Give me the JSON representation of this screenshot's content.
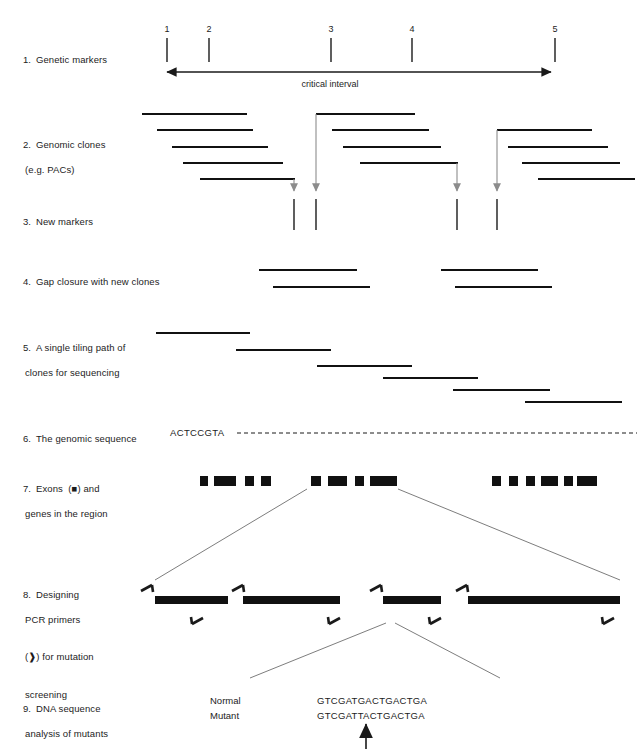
{
  "figure": {
    "colors": {
      "ink": "#1a1a1a",
      "clone_line": "#111111",
      "gray_arrow": "#8c8c8c",
      "connector": "#6e6e6e",
      "exon_fill": "#111111"
    }
  },
  "rows": [
    {
      "num": "1.",
      "line1": "Genetic markers",
      "line2": ""
    },
    {
      "num": "2.",
      "line1": "Genomic clones",
      "line2": "(e.g. PACs)"
    },
    {
      "num": "3.",
      "line1": "New markers",
      "line2": ""
    },
    {
      "num": "4.",
      "line1": "Gap closure with new clones",
      "line2": ""
    },
    {
      "num": "5.",
      "line1": "A single tiling path of",
      "line2": "clones for sequencing"
    },
    {
      "num": "6.",
      "line1": "The genomic sequence",
      "line2": ""
    },
    {
      "num": "7.",
      "line1": "Exons  (■) and",
      "line2": "genes in the region"
    },
    {
      "num": "8.",
      "line1": "Designing",
      "line2": "PCR primers",
      "line3": "(❱) for mutation",
      "line4": "screening"
    },
    {
      "num": "9.",
      "line1": "DNA sequence",
      "line2": "analysis of mutants"
    }
  ],
  "genetic_markers": {
    "labels": [
      "1",
      "2",
      "3",
      "4",
      "5"
    ],
    "x_positions": [
      167,
      209,
      331,
      412,
      555
    ],
    "tick_top": 38,
    "tick_bottom": 62,
    "axis_y": 72,
    "axis_start": 160,
    "axis_end": 558,
    "interval_label": "critical interval",
    "interval_label_x": 330,
    "interval_label_y": 79
  },
  "genomic_clones": {
    "group_a": [
      {
        "x1": 142,
        "x2": 247,
        "y": 114
      },
      {
        "x1": 157,
        "x2": 253,
        "y": 130
      },
      {
        "x1": 172,
        "x2": 268,
        "y": 147
      },
      {
        "x1": 183,
        "x2": 283,
        "y": 163
      },
      {
        "x1": 200,
        "x2": 295,
        "y": 179
      }
    ],
    "group_b": [
      {
        "x1": 316,
        "x2": 415,
        "y": 114
      },
      {
        "x1": 332,
        "x2": 429,
        "y": 130
      },
      {
        "x1": 343,
        "x2": 441,
        "y": 147
      },
      {
        "x1": 360,
        "x2": 458,
        "y": 163
      }
    ],
    "group_c": [
      {
        "x1": 497,
        "x2": 592,
        "y": 130
      },
      {
        "x1": 508,
        "x2": 608,
        "y": 147
      },
      {
        "x1": 522,
        "x2": 620,
        "y": 163
      },
      {
        "x1": 538,
        "x2": 635,
        "y": 179
      }
    ]
  },
  "new_markers": {
    "gray_arrows": [
      {
        "x": 294,
        "y1": 179,
        "y2": 196
      },
      {
        "x": 316,
        "y1": 114,
        "y2": 196
      },
      {
        "x": 457,
        "y1": 163,
        "y2": 196
      },
      {
        "x": 497,
        "y1": 130,
        "y2": 196
      }
    ],
    "ticks": [
      {
        "x": 294,
        "y1": 199,
        "y2": 230
      },
      {
        "x": 316,
        "y1": 199,
        "y2": 230
      },
      {
        "x": 457,
        "y1": 199,
        "y2": 230
      },
      {
        "x": 497,
        "y1": 199,
        "y2": 230
      }
    ]
  },
  "gap_closure": {
    "clones": [
      {
        "x1": 259,
        "x2": 357,
        "y": 270
      },
      {
        "x1": 273,
        "x2": 370,
        "y": 287
      },
      {
        "x1": 441,
        "x2": 538,
        "y": 270
      },
      {
        "x1": 455,
        "x2": 552,
        "y": 287
      }
    ]
  },
  "tiling_path": {
    "clones": [
      {
        "x1": 156,
        "x2": 250,
        "y": 333
      },
      {
        "x1": 236,
        "x2": 331,
        "y": 350
      },
      {
        "x1": 317,
        "x2": 412,
        "y": 366
      },
      {
        "x1": 383,
        "x2": 478,
        "y": 378
      },
      {
        "x1": 453,
        "x2": 550,
        "y": 390
      },
      {
        "x1": 525,
        "x2": 622,
        "y": 402
      }
    ]
  },
  "genomic_sequence": {
    "text": "ACTCCGTA",
    "text_x": 170,
    "text_y": 427,
    "dash_x1": 237,
    "dash_x2": 637,
    "dash_y": 433
  },
  "exons": {
    "y": 476,
    "height": 10,
    "group_1": [
      {
        "x": 200,
        "w": 8
      },
      {
        "x": 214,
        "w": 22
      },
      {
        "x": 245,
        "w": 9
      },
      {
        "x": 261,
        "w": 10
      }
    ],
    "group_2": [
      {
        "x": 311,
        "w": 10
      },
      {
        "x": 328,
        "w": 19
      },
      {
        "x": 355,
        "w": 9
      },
      {
        "x": 370,
        "w": 27
      }
    ],
    "group_3": [
      {
        "x": 492,
        "w": 9
      },
      {
        "x": 509,
        "w": 9
      },
      {
        "x": 526,
        "w": 9
      },
      {
        "x": 541,
        "w": 17
      },
      {
        "x": 564,
        "w": 9
      },
      {
        "x": 577,
        "w": 20
      }
    ]
  },
  "expansion_lines_top": [
    {
      "x1": 307,
      "y1": 489,
      "x2": 155,
      "y2": 580
    },
    {
      "x1": 398,
      "y1": 489,
      "x2": 620,
      "y2": 580
    }
  ],
  "pcr": {
    "bars": [
      {
        "x1": 155,
        "x2": 228,
        "y": 600
      },
      {
        "x1": 243,
        "x2": 340,
        "y": 600
      },
      {
        "x1": 383,
        "x2": 441,
        "y": 600
      },
      {
        "x1": 468,
        "x2": 620,
        "y": 600
      }
    ],
    "forward_primers": [
      {
        "x": 141,
        "y": 583
      },
      {
        "x": 232,
        "y": 583
      },
      {
        "x": 370,
        "y": 583
      },
      {
        "x": 456,
        "y": 583
      }
    ],
    "reverse_primers": [
      {
        "x": 203,
        "y": 617
      },
      {
        "x": 340,
        "y": 617
      },
      {
        "x": 441,
        "y": 617
      },
      {
        "x": 614,
        "y": 617
      }
    ]
  },
  "expansion_lines_bottom": [
    {
      "x1": 386,
      "y1": 623,
      "x2": 250,
      "y2": 678
    },
    {
      "x1": 395,
      "y1": 623,
      "x2": 500,
      "y2": 678
    }
  ],
  "dna_analysis": {
    "rows": [
      {
        "label": "Normal",
        "sequence": "GTCGATGACTGACTGA"
      },
      {
        "label": "Mutant",
        "sequence": "GTCGATTACTGACTGA"
      }
    ],
    "label_x": 210,
    "seq_x": 317,
    "row1_y": 695,
    "row2_y": 710,
    "pointer": {
      "x": 366,
      "y_top": 718,
      "y_bottom": 749
    }
  }
}
